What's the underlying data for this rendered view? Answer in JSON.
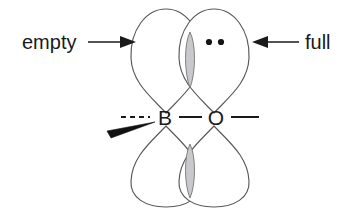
{
  "figure": {
    "type": "chemical-orbital-diagram",
    "background_color": "#ffffff",
    "outline_color": "#58585a",
    "ink_color": "#1a1a1a",
    "overlap_fill_color": "#c9c9cb"
  },
  "atoms": {
    "left": {
      "symbol": "B",
      "name": "boron"
    },
    "right": {
      "symbol": "O",
      "name": "oxygen"
    }
  },
  "bonds": {
    "left_external": {
      "style": "dashed",
      "label": "---"
    },
    "center": {
      "style": "solid",
      "label": "—"
    },
    "right_external": {
      "style": "solid",
      "label": "—"
    },
    "wedge": {
      "style": "bold-wedge",
      "attached_to": "B"
    }
  },
  "annotations": {
    "left": {
      "label": "empty",
      "arrow_direction": "right",
      "points_to": "boron-p-orbital"
    },
    "right": {
      "label": "full",
      "arrow_direction": "left",
      "points_to": "oxygen-p-orbital"
    }
  },
  "lone_pair": {
    "count": 2,
    "glyph": "••",
    "location": "oxygen-upper-lobe"
  },
  "orbitals": [
    {
      "id": "boron-upper-lobe",
      "atom": "B",
      "position": "upper",
      "filled": false
    },
    {
      "id": "boron-lower-lobe",
      "atom": "B",
      "position": "lower",
      "filled": false
    },
    {
      "id": "oxygen-upper-lobe",
      "atom": "O",
      "position": "upper",
      "filled": true
    },
    {
      "id": "oxygen-lower-lobe",
      "atom": "O",
      "position": "lower",
      "filled": true
    }
  ],
  "overlaps": [
    {
      "id": "upper-overlap-lens",
      "between": [
        "boron-upper-lobe",
        "oxygen-upper-lobe"
      ]
    },
    {
      "id": "lower-overlap-lens",
      "between": [
        "boron-lower-lobe",
        "oxygen-lower-lobe"
      ]
    }
  ]
}
